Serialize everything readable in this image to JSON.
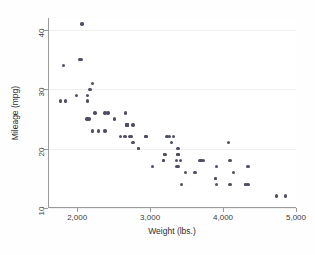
{
  "chart_data": {
    "type": "scatter",
    "title": "",
    "subtitle": "",
    "xlabel": "Weight (lbs.)",
    "ylabel": "Mileage (mpg)",
    "xlim": [
      1600,
      5000
    ],
    "ylim": [
      10,
      42
    ],
    "xticks": [
      2000,
      3000,
      4000,
      5000
    ],
    "xtick_labels": [
      "2,000",
      "3,000",
      "4,000",
      "5,000"
    ],
    "yticks": [
      10,
      20,
      30,
      40
    ],
    "ytick_labels": [
      "10",
      "20",
      "30",
      "40"
    ],
    "grid": "horizontal-faint",
    "legend": null,
    "marker_color": "#4e4f63",
    "marker_size_px": 3.4,
    "n_points": 74,
    "series": [
      {
        "name": "cars",
        "x": [
          2930,
          3350,
          2640,
          3250,
          4080,
          3670,
          2230,
          3280,
          3880,
          3400,
          3020,
          3180,
          4330,
          3900,
          4290,
          4080,
          3350,
          3900,
          4330,
          4290,
          3370,
          2730,
          2130,
          3470,
          3600,
          2830,
          2580,
          3370,
          2750,
          2130,
          3420,
          3880,
          4130,
          3200,
          2500,
          2200,
          2150,
          2670,
          2370,
          2020,
          2280,
          2750,
          3170,
          2710,
          3690,
          3180,
          3220,
          4060,
          3720,
          3370,
          2930,
          4720,
          4840,
          3310,
          3690,
          3370,
          2830,
          2120,
          1800,
          2050,
          2410,
          2200,
          2670,
          1760,
          2160,
          2670,
          2370,
          1980,
          2670,
          2130,
          3170,
          2650,
          2040,
          1830
        ],
        "y": [
          22,
          17,
          22,
          22,
          18,
          18,
          26,
          21,
          15,
          18,
          17,
          19,
          17,
          17,
          14,
          14,
          18,
          14,
          14,
          14,
          17,
          22,
          29,
          16,
          16,
          20,
          22,
          19,
          24,
          28,
          14,
          15,
          16,
          19,
          25,
          23,
          25,
          24,
          23,
          35,
          23,
          21,
          18,
          22,
          18,
          19,
          22,
          21,
          18,
          20,
          22,
          12,
          12,
          22,
          18,
          19,
          20,
          25,
          34,
          41,
          26,
          31,
          24,
          28,
          30,
          24,
          26,
          29,
          24,
          25,
          18,
          26,
          35,
          28
        ]
      }
    ]
  },
  "axes": {
    "y_title": "Mileage (mpg)",
    "x_title": "Weight (lbs.)"
  }
}
